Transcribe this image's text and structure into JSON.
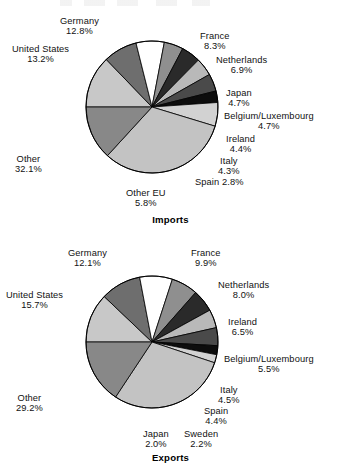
{
  "chart_data": [
    {
      "type": "pie",
      "title": "Imports",
      "id": "imports",
      "start_angle_deg": 180,
      "direction": "clockwise",
      "categories": [
        "Germany",
        "France",
        "Netherlands",
        "Japan",
        "Belgium/Luxembourg",
        "Ireland",
        "Italy",
        "Spain",
        "Other EU",
        "Other",
        "United States"
      ],
      "values": [
        12.8,
        8.3,
        6.9,
        4.7,
        4.7,
        4.4,
        4.3,
        2.8,
        5.8,
        32.1,
        13.2
      ],
      "value_labels": [
        "12.8%",
        "8.3%",
        "6.9%",
        "4.7%",
        "4.7%",
        "4.4%",
        "4.3%",
        "2.8%",
        "5.8%",
        "32.1%",
        "13.2%"
      ],
      "colors": [
        "#c8c8c8",
        "#6e6e6e",
        "#ffffff",
        "#8f8f8f",
        "#2a2a2a",
        "#b9b9b9",
        "#4a4a4a",
        "#0d0d0d",
        "#d2d2d2",
        "#c3c3c3",
        "#888888"
      ],
      "xlabel": "",
      "ylabel": "",
      "legend": "labels-outside"
    },
    {
      "type": "pie",
      "title": "Exports",
      "id": "exports",
      "start_angle_deg": 180,
      "direction": "clockwise",
      "categories": [
        "Germany",
        "France",
        "Netherlands",
        "Ireland",
        "Belgium/Luxembourg",
        "Italy",
        "Spain",
        "Sweden",
        "Japan",
        "Other",
        "United States"
      ],
      "values": [
        12.1,
        9.9,
        8.0,
        6.5,
        5.5,
        4.5,
        4.4,
        2.2,
        2.0,
        29.2,
        15.7
      ],
      "value_labels": [
        "12.1%",
        "9.9%",
        "8.0%",
        "6.5%",
        "5.5%",
        "4.5%",
        "4.4%",
        "2.2%",
        "2.0%",
        "29.2%",
        "15.7%"
      ],
      "colors": [
        "#c8c8c8",
        "#6e6e6e",
        "#ffffff",
        "#8f8f8f",
        "#2a2a2a",
        "#b9b9b9",
        "#4a4a4a",
        "#0d0d0d",
        "#d2d2d2",
        "#c3c3c3",
        "#888888"
      ],
      "xlabel": "",
      "ylabel": "",
      "legend": "labels-outside"
    }
  ],
  "imports": {
    "caption": "Imports",
    "labels": [
      {
        "name": "Germany",
        "value": "12.8%",
        "x": 60,
        "y": 16,
        "align": "c",
        "inline": false
      },
      {
        "name": "France",
        "value": "8.3%",
        "x": 200,
        "y": 31,
        "align": "c",
        "inline": false
      },
      {
        "name": "Netherlands",
        "value": "6.9%",
        "x": 216,
        "y": 55,
        "align": "c",
        "inline": false
      },
      {
        "name": "Japan",
        "value": "4.7%",
        "x": 226,
        "y": 88,
        "align": "c",
        "inline": false
      },
      {
        "name": "Belgium/Luxembourg",
        "value": "4.7%",
        "x": 224,
        "y": 111,
        "align": "c",
        "inline": false
      },
      {
        "name": "Ireland",
        "value": "4.4%",
        "x": 226,
        "y": 134,
        "align": "c",
        "inline": false
      },
      {
        "name": "Italy",
        "value": "4.3%",
        "x": 218,
        "y": 156,
        "align": "c",
        "inline": false
      },
      {
        "name": "Spain",
        "value": "2.8%",
        "x": 195,
        "y": 177,
        "align": "c",
        "inline": true
      },
      {
        "name": "Other EU",
        "value": "5.8%",
        "x": 126,
        "y": 188,
        "align": "c",
        "inline": false
      },
      {
        "name": "Other",
        "value": "32.1%",
        "x": 15,
        "y": 154,
        "align": "c",
        "inline": false
      },
      {
        "name": "United States",
        "value": "13.2%",
        "x": 12,
        "y": 44,
        "align": "c",
        "inline": false
      }
    ]
  },
  "exports": {
    "caption": "Exports",
    "labels": [
      {
        "name": "Germany",
        "value": "12.1%",
        "x": 68,
        "y": 12,
        "align": "c",
        "inline": false
      },
      {
        "name": "France",
        "value": "9.9%",
        "x": 191,
        "y": 12,
        "align": "c",
        "inline": false
      },
      {
        "name": "Netherlands",
        "value": "8.0%",
        "x": 218,
        "y": 44,
        "align": "c",
        "inline": false
      },
      {
        "name": "Ireland",
        "value": "6.5%",
        "x": 228,
        "y": 81,
        "align": "c",
        "inline": false
      },
      {
        "name": "Belgium/Luxembourg",
        "value": "5.5%",
        "x": 224,
        "y": 118,
        "align": "c",
        "inline": false
      },
      {
        "name": "Italy",
        "value": "4.5%",
        "x": 218,
        "y": 149,
        "align": "c",
        "inline": false
      },
      {
        "name": "Spain",
        "value": "4.4%",
        "x": 204,
        "y": 170,
        "align": "c",
        "inline": false
      },
      {
        "name": "Sweden",
        "value": "2.2%",
        "x": 184,
        "y": 193,
        "align": "c",
        "inline": false
      },
      {
        "name": "Japan",
        "value": "2.0%",
        "x": 143,
        "y": 193,
        "align": "c",
        "inline": false
      },
      {
        "name": "Other",
        "value": "29.2%",
        "x": 16,
        "y": 157,
        "align": "c",
        "inline": false
      },
      {
        "name": "United States",
        "value": "15.7%",
        "x": 6,
        "y": 54,
        "align": "c",
        "inline": false
      }
    ]
  }
}
